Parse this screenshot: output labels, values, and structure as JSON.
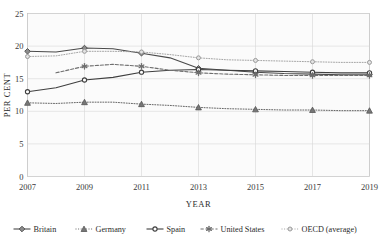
{
  "chart_data": {
    "type": "line",
    "title": "",
    "xlabel": "YEAR",
    "ylabel": "PER CENT",
    "x": [
      2007,
      2008,
      2009,
      2010,
      2011,
      2012,
      2013,
      2014,
      2015,
      2016,
      2017,
      2018,
      2019
    ],
    "xlim": [
      2007,
      2019
    ],
    "ylim": [
      0,
      25
    ],
    "xticks": [
      "2007",
      "2009",
      "2011",
      "2013",
      "2015",
      "2017",
      "2019"
    ],
    "yticks": [
      "0",
      "5",
      "10",
      "15",
      "20",
      "25"
    ],
    "grid": true,
    "legend_position": "bottom",
    "series": [
      {
        "name": "Britain",
        "color": "#4a4a4a",
        "marker": "diamond",
        "dash": "solid",
        "values": [
          19.2,
          19.1,
          19.7,
          19.6,
          18.9,
          18.2,
          16.6,
          16.3,
          16.0,
          15.8,
          15.7,
          15.6,
          15.6
        ]
      },
      {
        "name": "Germany",
        "color": "#555555",
        "marker": "triangle",
        "dash": "dotted",
        "values": [
          11.3,
          11.2,
          11.4,
          11.4,
          11.1,
          10.9,
          10.6,
          10.4,
          10.3,
          10.2,
          10.2,
          10.1,
          10.1
        ]
      },
      {
        "name": "Spain",
        "color": "#3f3f3f",
        "marker": "circle",
        "dash": "solid",
        "values": [
          13.0,
          13.6,
          14.8,
          15.2,
          16.0,
          16.3,
          16.4,
          16.3,
          16.2,
          16.1,
          16.0,
          15.9,
          15.9
        ]
      },
      {
        "name": "United States",
        "color": "#6e6e6e",
        "marker": "asterisk",
        "dash": "dashed",
        "values": [
          null,
          15.9,
          16.9,
          17.2,
          16.9,
          16.3,
          15.9,
          15.7,
          15.6,
          15.5,
          15.5,
          15.5,
          15.5
        ]
      },
      {
        "name": "OECD (average)",
        "color": "#9a9a9a",
        "marker": "circle-open",
        "dash": "dotted",
        "values": [
          18.4,
          18.5,
          19.2,
          19.2,
          19.1,
          18.7,
          18.2,
          17.9,
          17.8,
          17.7,
          17.6,
          17.5,
          17.5
        ]
      }
    ]
  },
  "axis": {
    "y_title": "PER CENT",
    "x_title": "YEAR"
  },
  "legend": {
    "items": [
      {
        "label": "Britain"
      },
      {
        "label": "Germany"
      },
      {
        "label": "Spain"
      },
      {
        "label": "United States"
      },
      {
        "label": "OECD (average)"
      }
    ]
  }
}
